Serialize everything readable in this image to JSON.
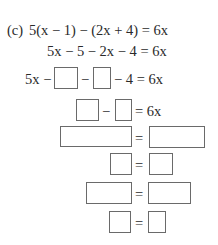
{
  "problem": {
    "label": "(c)",
    "equation": "5(x − 1) − (2x + 4) = 6x",
    "step1": "5x − 5 − 2x − 4 = 6x",
    "step2": {
      "prefix": "5x −",
      "mid": "−",
      "suffix": "− 4 = 6x"
    },
    "step3": {
      "mid": "−",
      "suffix": "= 6x"
    },
    "step4": {
      "eq": "="
    },
    "step5": {
      "eq": "="
    },
    "step6": {
      "eq": "="
    },
    "step7": {
      "eq": "="
    }
  }
}
